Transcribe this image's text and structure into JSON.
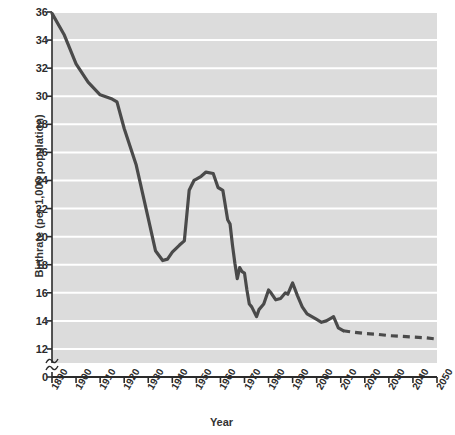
{
  "chart_data": {
    "type": "line",
    "title": "",
    "xlabel": "Year",
    "ylabel": "Birthrate (per 1,000 population)",
    "xlim": [
      1890,
      2050
    ],
    "ylim": [
      11,
      36
    ],
    "yticks": [
      12,
      14,
      16,
      18,
      20,
      22,
      24,
      26,
      28,
      30,
      32,
      34,
      36
    ],
    "ytick_labels": [
      "12",
      "14",
      "16",
      "18",
      "20",
      "22",
      "24",
      "26",
      "28",
      "30",
      "32",
      "34",
      "36"
    ],
    "axis_origin_label": "0",
    "axis_break": true,
    "xticks": [
      1890,
      1900,
      1910,
      1920,
      1930,
      1940,
      1950,
      1960,
      1970,
      1980,
      1990,
      2000,
      2010,
      2020,
      2030,
      2040,
      2050
    ],
    "xtick_labels": [
      "1890",
      "1900",
      "1910",
      "1920",
      "1930",
      "1940",
      "1950",
      "1960",
      "1970",
      "1980",
      "1990",
      "2000",
      "2010",
      "2020",
      "2030",
      "2040",
      "2050"
    ],
    "grid": true,
    "grid_orientation": "horizontal",
    "legend": null,
    "plot_background": "#dcdcdc",
    "grid_color": "#ffffff",
    "line_color": "#4a4a4a",
    "series": [
      {
        "name": "Historical birthrate",
        "style": "solid",
        "x": [
          1890,
          1895,
          1900,
          1905,
          1910,
          1915,
          1917,
          1920,
          1925,
          1930,
          1933,
          1936,
          1938,
          1940,
          1943,
          1945,
          1947,
          1949,
          1950,
          1952,
          1954,
          1957,
          1959,
          1961,
          1963,
          1964,
          1965,
          1966,
          1967,
          1968,
          1969,
          1970,
          1971,
          1972,
          1973,
          1975,
          1976,
          1978,
          1980,
          1981,
          1983,
          1985,
          1987,
          1988,
          1990,
          1992,
          1994,
          1996,
          1998,
          2000,
          2002,
          2004,
          2006,
          2007,
          2009,
          2011
        ],
        "y": [
          35.9,
          34.4,
          32.3,
          31.0,
          30.1,
          29.8,
          29.6,
          27.7,
          25.1,
          21.3,
          19.0,
          18.3,
          18.4,
          18.9,
          19.4,
          19.7,
          23.3,
          24.0,
          24.1,
          24.3,
          24.6,
          24.5,
          23.5,
          23.3,
          21.2,
          20.9,
          19.4,
          18.1,
          17.0,
          17.8,
          17.5,
          17.4,
          16.2,
          15.2,
          15.0,
          14.3,
          14.8,
          15.2,
          16.2,
          16.0,
          15.5,
          15.6,
          16.0,
          15.9,
          16.7,
          15.8,
          15.0,
          14.5,
          14.3,
          14.1,
          13.9,
          14.0,
          14.2,
          14.3,
          13.5,
          13.3
        ]
      },
      {
        "name": "Projected birthrate",
        "style": "dashed",
        "x": [
          2011,
          2015,
          2020,
          2025,
          2030,
          2035,
          2040,
          2045,
          2050
        ],
        "y": [
          13.3,
          13.2,
          13.1,
          13.05,
          12.95,
          12.9,
          12.85,
          12.8,
          12.7
        ]
      }
    ]
  },
  "figure": {
    "plot_left": 52,
    "plot_right": 437,
    "plot_top": 12,
    "plot_bottom": 363,
    "axis_baseline": 377
  }
}
